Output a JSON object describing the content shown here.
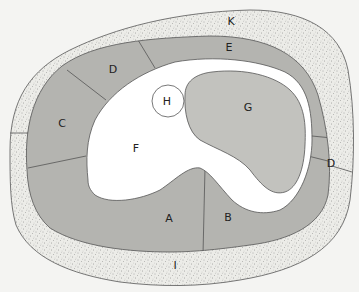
{
  "diagram": {
    "type": "cross-section anatomical diagram",
    "colors": {
      "background": "#f4f4f2",
      "stipple_ring": "#ecece8",
      "stipple_dot": "#6a6a6a",
      "segment_fill": "#b4b4b0",
      "blob_fill": "#c2c2be",
      "cavity_fill": "#ffffff",
      "outline": "#555555"
    },
    "labels": {
      "K": "K",
      "E": "E",
      "D_upper": "D",
      "C": "C",
      "H": "H",
      "G": "G",
      "F": "F",
      "D_right": "D",
      "A": "A",
      "B": "B",
      "I": "I"
    },
    "regions": [
      {
        "id": "K",
        "description": "outer stippled layer (top)"
      },
      {
        "id": "I",
        "description": "outer stippled layer (bottom)"
      },
      {
        "id": "E",
        "description": "gray segment, top"
      },
      {
        "id": "D_upper",
        "description": "gray segment, upper left"
      },
      {
        "id": "C",
        "description": "gray segment, left"
      },
      {
        "id": "A",
        "description": "gray segment, bottom left"
      },
      {
        "id": "B",
        "description": "gray segment, bottom right"
      },
      {
        "id": "D_right",
        "description": "gray segment, right"
      },
      {
        "id": "F",
        "description": "white central cavity"
      },
      {
        "id": "G",
        "description": "light gray kidney-shaped body"
      },
      {
        "id": "H",
        "description": "small white circle"
      }
    ]
  }
}
